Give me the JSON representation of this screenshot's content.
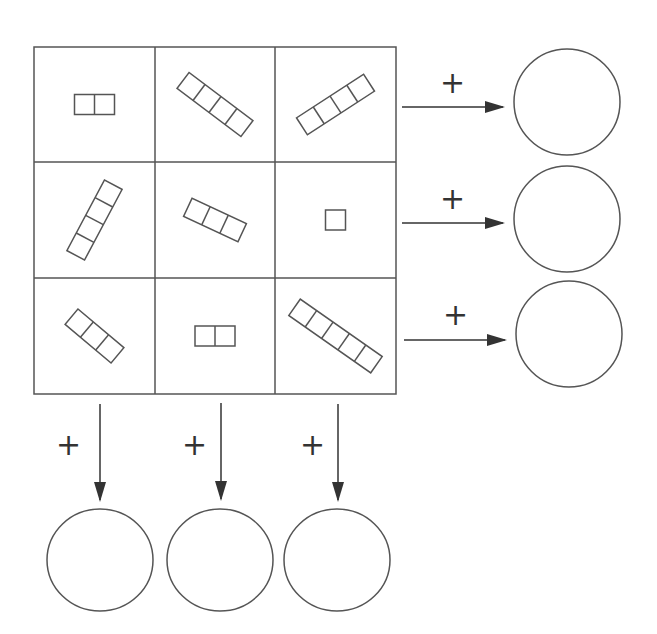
{
  "puzzle": {
    "grid": {
      "rows": 3,
      "cols": 3,
      "cells": [
        {
          "row": 0,
          "col": 0,
          "squares": 2,
          "angle": 0
        },
        {
          "row": 0,
          "col": 1,
          "squares": 4,
          "angle": 37
        },
        {
          "row": 0,
          "col": 2,
          "squares": 4,
          "angle": -33
        },
        {
          "row": 1,
          "col": 0,
          "squares": 4,
          "angle": -62
        },
        {
          "row": 1,
          "col": 1,
          "squares": 3,
          "angle": 25
        },
        {
          "row": 1,
          "col": 2,
          "squares": 1,
          "angle": 0
        },
        {
          "row": 2,
          "col": 0,
          "squares": 3,
          "angle": 40
        },
        {
          "row": 2,
          "col": 1,
          "squares": 2,
          "angle": 0
        },
        {
          "row": 2,
          "col": 2,
          "squares": 5,
          "angle": 35
        }
      ]
    },
    "operator": "+",
    "row_sums": [
      {
        "label": "+",
        "answer": ""
      },
      {
        "label": "+",
        "answer": ""
      },
      {
        "label": "+",
        "answer": ""
      }
    ],
    "col_sums": [
      {
        "label": "+",
        "answer": ""
      },
      {
        "label": "+",
        "answer": ""
      },
      {
        "label": "+",
        "answer": ""
      }
    ]
  },
  "colors": {
    "stroke": "#555555",
    "arrow": "#333333",
    "background": "#ffffff"
  }
}
